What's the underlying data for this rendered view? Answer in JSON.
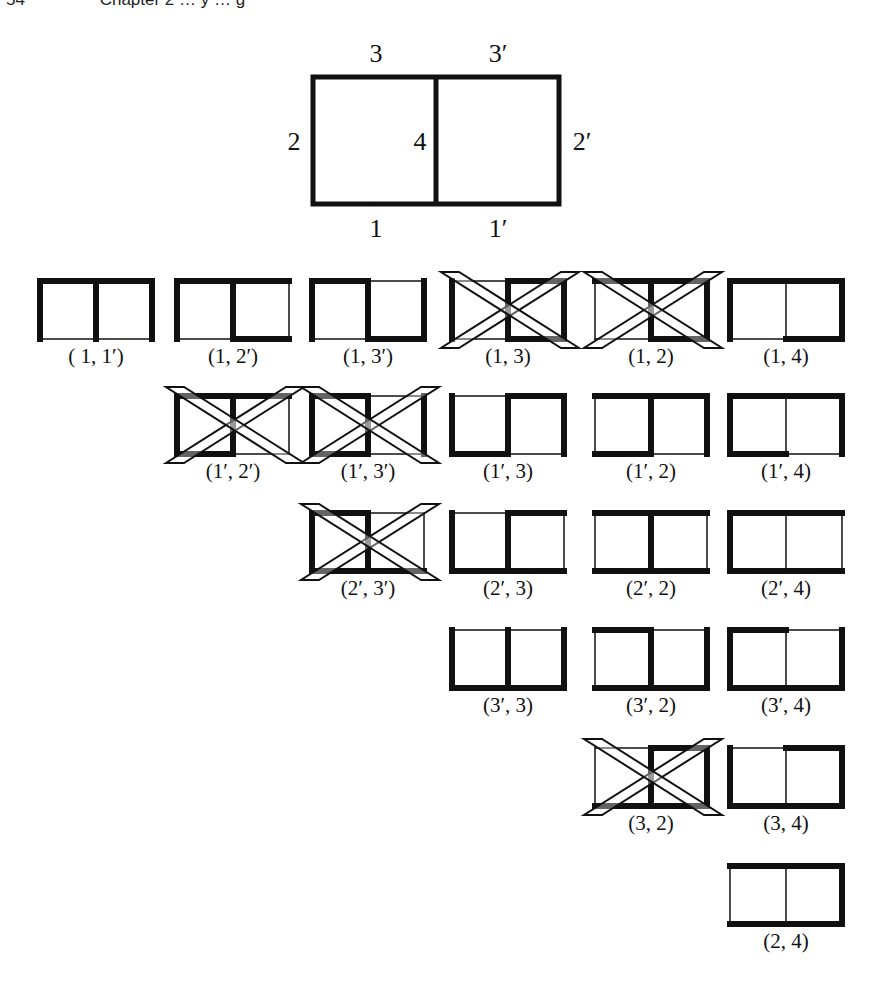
{
  "header": {
    "page_number": "54",
    "running_title": "Chapter 2 … y … g"
  },
  "main_figure": {
    "description": "Two adjacent squares forming a 2x1 rectangle with labeled edges",
    "edge_labels": {
      "top_left": "3",
      "top_right": "3′",
      "left": "2",
      "middle": "4",
      "right": "2′",
      "bottom_left": "1",
      "bottom_right": "1′"
    }
  },
  "style": {
    "line_color": "#111111",
    "thick_width": 6,
    "thin_width": 1.5,
    "background": "#ffffff"
  },
  "pairs": [
    {
      "label": "( 1, 1′)",
      "row": 0,
      "col": 0,
      "removed": [
        "1",
        "1′"
      ],
      "crossed": false
    },
    {
      "label": "(1, 2′)",
      "row": 0,
      "col": 1,
      "removed": [
        "1",
        "2′"
      ],
      "crossed": false
    },
    {
      "label": "(1, 3′)",
      "row": 0,
      "col": 2,
      "removed": [
        "1",
        "3′"
      ],
      "crossed": false
    },
    {
      "label": "(1, 3)",
      "row": 0,
      "col": 3,
      "removed": [
        "1",
        "3"
      ],
      "crossed": true
    },
    {
      "label": "(1, 2)",
      "row": 0,
      "col": 4,
      "removed": [
        "1",
        "2"
      ],
      "crossed": true
    },
    {
      "label": "(1, 4)",
      "row": 0,
      "col": 5,
      "removed": [
        "1",
        "4"
      ],
      "crossed": false
    },
    {
      "label": "(1′, 2′)",
      "row": 1,
      "col": 1,
      "removed": [
        "1′",
        "2′"
      ],
      "crossed": true
    },
    {
      "label": "(1′, 3′)",
      "row": 1,
      "col": 2,
      "removed": [
        "1′",
        "3′"
      ],
      "crossed": true
    },
    {
      "label": "(1′, 3)",
      "row": 1,
      "col": 3,
      "removed": [
        "1′",
        "3"
      ],
      "crossed": false
    },
    {
      "label": "(1′, 2)",
      "row": 1,
      "col": 4,
      "removed": [
        "1′",
        "2"
      ],
      "crossed": false
    },
    {
      "label": "(1′, 4)",
      "row": 1,
      "col": 5,
      "removed": [
        "1′",
        "4"
      ],
      "crossed": false
    },
    {
      "label": "(2′, 3′)",
      "row": 2,
      "col": 2,
      "removed": [
        "2′",
        "3′"
      ],
      "crossed": true
    },
    {
      "label": "(2′, 3)",
      "row": 2,
      "col": 3,
      "removed": [
        "2′",
        "3"
      ],
      "crossed": false
    },
    {
      "label": "(2′, 2)",
      "row": 2,
      "col": 4,
      "removed": [
        "2′",
        "2"
      ],
      "crossed": false
    },
    {
      "label": "(2′, 4)",
      "row": 2,
      "col": 5,
      "removed": [
        "2′",
        "4"
      ],
      "crossed": false
    },
    {
      "label": "(3′, 3)",
      "row": 3,
      "col": 3,
      "removed": [
        "3′",
        "3"
      ],
      "crossed": false
    },
    {
      "label": "(3′, 2)",
      "row": 3,
      "col": 4,
      "removed": [
        "3′",
        "2"
      ],
      "crossed": false
    },
    {
      "label": "(3′, 4)",
      "row": 3,
      "col": 5,
      "removed": [
        "3′",
        "4"
      ],
      "crossed": false
    },
    {
      "label": "(3, 2)",
      "row": 4,
      "col": 4,
      "removed": [
        "3",
        "2"
      ],
      "crossed": true
    },
    {
      "label": "(3, 4)",
      "row": 4,
      "col": 5,
      "removed": [
        "3",
        "4"
      ],
      "crossed": false
    },
    {
      "label": "(2, 4)",
      "row": 5,
      "col": 5,
      "removed": [
        "2",
        "4"
      ],
      "crossed": false
    }
  ],
  "layout_grid": {
    "col_x": [
      40,
      177,
      312,
      452,
      595,
      730
    ],
    "row_y": [
      281,
      396,
      513,
      630,
      748,
      866
    ],
    "box_w": 112,
    "box_h": 58
  }
}
